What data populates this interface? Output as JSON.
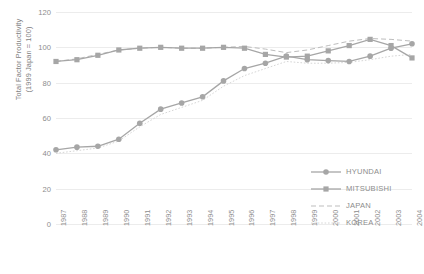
{
  "chart_data": {
    "type": "line",
    "title": "",
    "xlabel": "",
    "ylabel": "Total Factor Productivity\n(1999 Japan = 100)",
    "ylim": [
      0,
      120
    ],
    "yticks": [
      0,
      20,
      40,
      60,
      80,
      100,
      120
    ],
    "grid": true,
    "legend_position": "right-center",
    "categories": [
      "1987",
      "1988",
      "1989",
      "1990",
      "1991",
      "1992",
      "1993",
      "1994",
      "1995",
      "1996",
      "1997",
      "1998",
      "1999",
      "2000",
      "2001",
      "2002",
      "2003",
      "2004"
    ],
    "series": [
      {
        "name": "HYUNDAI",
        "marker": "circle",
        "linestyle": "solid",
        "color": "#a6a6a6",
        "values": [
          42,
          43.5,
          44,
          48,
          57,
          65,
          68.5,
          72,
          81,
          88,
          91,
          95,
          93,
          92.5,
          92,
          95,
          99.5,
          102
        ]
      },
      {
        "name": "MITSUBISHI",
        "marker": "square",
        "linestyle": "solid",
        "color": "#a6a6a6",
        "values": [
          92,
          93,
          95.5,
          98.5,
          99.5,
          100,
          99.5,
          99.5,
          100,
          99.5,
          96,
          94.5,
          95,
          98,
          101,
          104.5,
          101,
          94
        ]
      },
      {
        "name": "JAPAN",
        "marker": "none",
        "linestyle": "dashed",
        "color": "#bdbdbd",
        "values": [
          92,
          93.5,
          96,
          98.5,
          99.5,
          100,
          99.5,
          99.5,
          100,
          100.5,
          99,
          97,
          98.5,
          101,
          103.5,
          105,
          104.5,
          103.5
        ]
      },
      {
        "name": "KOREA",
        "marker": "none",
        "linestyle": "dotted",
        "color": "#d6d6d6",
        "values": [
          40,
          41.5,
          43,
          47,
          55,
          62,
          66,
          70,
          78,
          84,
          88,
          92,
          91,
          91,
          91.5,
          93,
          95,
          96
        ]
      }
    ]
  },
  "legend": {
    "items": [
      {
        "label": "HYUNDAI"
      },
      {
        "label": "MITSUBISHI"
      },
      {
        "label": "JAPAN"
      },
      {
        "label": "KOREA"
      }
    ]
  }
}
